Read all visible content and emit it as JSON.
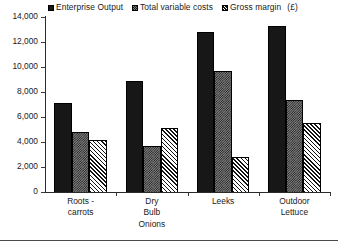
{
  "chart_data": {
    "type": "bar",
    "title": "",
    "xlabel": "",
    "ylabel": "",
    "ylim": [
      0,
      14000
    ],
    "ytick_step": 2000,
    "yticks": [
      "14,000",
      "12,000",
      "10,000",
      "8,000",
      "6,000",
      "4,000",
      "2,000",
      "0"
    ],
    "ytick_values": [
      14000,
      12000,
      10000,
      8000,
      6000,
      4000,
      2000,
      0
    ],
    "grid": false,
    "legend_position": "top",
    "unit_note": "(£)",
    "categories": [
      "Roots -\ncarrots",
      "Dry\nBulb\nOnions",
      "Leeks",
      "Outdoor\nLettuce"
    ],
    "series": [
      {
        "name": "Enterprise Output",
        "pattern": "solid-black",
        "color": "#171717",
        "values": [
          7100,
          8900,
          12800,
          13300
        ]
      },
      {
        "name": "Total variable costs",
        "pattern": "checkered-gray",
        "color": "#808080",
        "values": [
          4800,
          3650,
          9700,
          7350
        ]
      },
      {
        "name": "Gross margin",
        "pattern": "diagonal-hatch",
        "color": "#ffffff",
        "values": [
          4200,
          5100,
          2800,
          5550
        ]
      }
    ]
  }
}
